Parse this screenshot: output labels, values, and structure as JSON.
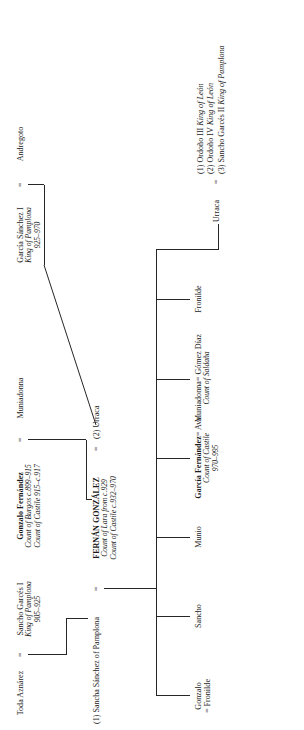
{
  "diagram": {
    "type": "family-tree",
    "orientation": "rotated-90-ccw",
    "generations": [
      {
        "id": "gen-1",
        "nodes": [
          {
            "id": "toda-aznarez",
            "name": "Toda Aznárez",
            "style": "plain",
            "lines": []
          },
          {
            "id": "sancho-garces-i",
            "name": "Sancho Garcés I",
            "style": "plain",
            "lines": [
              "King of Pamplona",
              "905–925"
            ]
          },
          {
            "id": "gonzalo-fernandez",
            "name": "Gonzalo Fernández",
            "style": "bold",
            "lines": [
              "Count of Burgos c.899–915",
              "Count of Castile 915–c.917"
            ]
          },
          {
            "id": "muniadonna-1",
            "name": "Muniadonna",
            "style": "plain",
            "lines": []
          },
          {
            "id": "garcia-sanchez-i",
            "name": "García Sánchez I",
            "style": "plain",
            "lines": [
              "King of Pamplona",
              "925–970"
            ]
          },
          {
            "id": "andregoto",
            "name": "Andregoto",
            "style": "plain",
            "lines": []
          }
        ]
      },
      {
        "id": "gen-2",
        "nodes": [
          {
            "id": "sancha-sanchez",
            "marriage_order": "(1)",
            "name": "Sancha Sánchez of Pamplona",
            "style": "plain",
            "lines": []
          },
          {
            "id": "fernan-gonzalez",
            "name": "FERNÁN GONZÁLEZ",
            "style": "caps-bold",
            "lines": [
              "Count of Lara from c.929",
              "Count of Castile c.932–970"
            ]
          },
          {
            "id": "urraca-wife",
            "marriage_order": "(2)",
            "name": "Urraca",
            "style": "plain",
            "lines": []
          }
        ]
      },
      {
        "id": "gen-3",
        "nodes": [
          {
            "id": "gonzalo",
            "name": "Gonzalo",
            "spouse_line": "= Fronilde",
            "style": "plain",
            "lines": []
          },
          {
            "id": "sancho",
            "name": "Sancho",
            "style": "plain",
            "lines": []
          },
          {
            "id": "munio",
            "name": "Munio",
            "style": "plain",
            "lines": []
          },
          {
            "id": "garcia-fernandez",
            "name": "García Fernández",
            "spouse_line": "= Ava",
            "style": "bold",
            "lines": [
              "Count of Castile",
              "970–995"
            ]
          },
          {
            "id": "muniadonna-2",
            "name": "Muniadonna",
            "spouse_line": "= Gómez Díaz",
            "style": "plain",
            "lines": [
              "Count of Saldaña"
            ]
          },
          {
            "id": "fronilde",
            "name": "Fronilde",
            "style": "plain",
            "lines": []
          },
          {
            "id": "urraca-daughter",
            "name": "Urraca",
            "style": "plain",
            "lines": [],
            "issue": [
              {
                "order": "(1)",
                "name": "Ordoño III",
                "title": "King of León"
              },
              {
                "order": "(2)",
                "name": "Ordoño IV",
                "title": "King of León"
              },
              {
                "order": "(3)",
                "name": "Sancho Garcés II",
                "title": "King of Pamplona"
              }
            ]
          }
        ]
      }
    ],
    "symbols": {
      "marriage": "=",
      "spouse_prefix": "="
    },
    "colors": {
      "line": "#262626",
      "text": "#1a1a1a",
      "background": "#ffffff"
    }
  }
}
